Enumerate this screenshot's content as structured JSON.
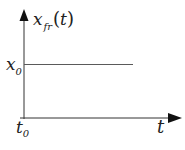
{
  "diagram": {
    "y_axis_label": {
      "main": "x",
      "sub": "fr",
      "arg_open": "(",
      "arg": "t",
      "arg_close": ")"
    },
    "x_axis_label": "t",
    "level_label": {
      "main": "x",
      "sub": "0"
    },
    "origin_label": {
      "main": "t",
      "sub": "0"
    },
    "colors": {
      "line": "#5a5a5a",
      "axis": "#333333",
      "text": "#222222",
      "background": "#ffffff"
    }
  }
}
